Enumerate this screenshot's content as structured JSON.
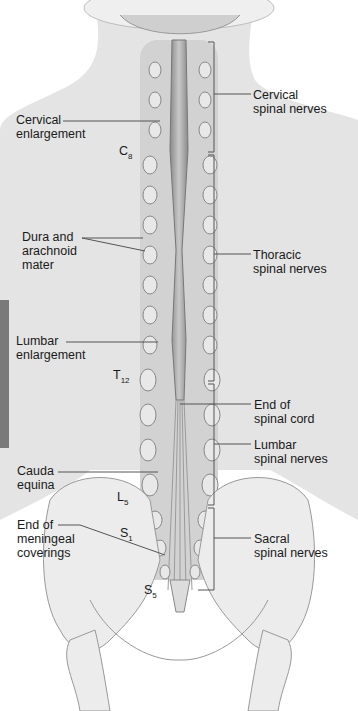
{
  "diagram": {
    "left_labels": [
      {
        "id": "cervical-enlargement",
        "lines": [
          "Cervical",
          "enlargement"
        ]
      },
      {
        "id": "dura-arachnoid",
        "lines": [
          "Dura and",
          "arachnoid",
          "mater"
        ]
      },
      {
        "id": "lumbar-enlargement",
        "lines": [
          "Lumbar",
          "enlargement"
        ]
      },
      {
        "id": "cauda-equina",
        "lines": [
          "Cauda",
          "equina"
        ]
      },
      {
        "id": "end-meningeal",
        "lines": [
          "End of",
          "meningeal",
          "coverings"
        ]
      }
    ],
    "right_labels": [
      {
        "id": "cervical-spinal-nerves",
        "lines": [
          "Cervical",
          "spinal nerves"
        ]
      },
      {
        "id": "thoracic-spinal-nerves",
        "lines": [
          "Thoracic",
          "spinal nerves"
        ]
      },
      {
        "id": "end-spinal-cord",
        "lines": [
          "End of",
          "spinal cord"
        ]
      },
      {
        "id": "lumbar-spinal-nerves",
        "lines": [
          "Lumbar",
          "spinal nerves"
        ]
      },
      {
        "id": "sacral-spinal-nerves",
        "lines": [
          "Sacral",
          "spinal nerves"
        ]
      }
    ],
    "vertebra_markers": [
      {
        "letter": "C",
        "sub": "8"
      },
      {
        "letter": "T",
        "sub": "12"
      },
      {
        "letter": "L",
        "sub": "5"
      },
      {
        "letter": "S",
        "sub": "1"
      },
      {
        "letter": "S",
        "sub": "5"
      }
    ]
  }
}
